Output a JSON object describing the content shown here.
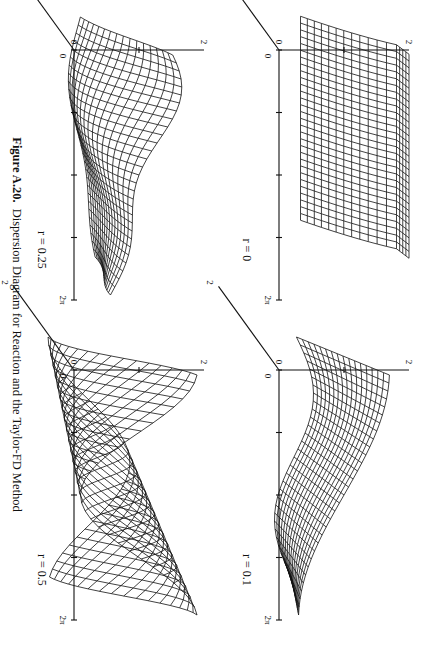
{
  "figure": {
    "number": "Figure A.20.",
    "caption": "Dispersion Diagram for Reaction and the Taylor-FD Method"
  },
  "axes": {
    "x_tick_labels": [
      "0",
      "2π"
    ],
    "x_ticks": 5,
    "z_tick_labels": [
      "0",
      "2"
    ],
    "depth_tick_labels": [
      "0",
      "2"
    ]
  },
  "panels": [
    {
      "id": "r0",
      "label": "r = 0",
      "position": "top-left"
    },
    {
      "id": "r01",
      "label": "r = 0.1",
      "position": "top-right"
    },
    {
      "id": "r025",
      "label": "r = 0.25",
      "position": "bottom-left"
    },
    {
      "id": "r05",
      "label": "r = 0.5",
      "position": "bottom-right"
    }
  ],
  "chart_data": [
    {
      "type": "surface",
      "title": "r = 0",
      "x_range": [
        "0",
        "2π"
      ],
      "z_range": [
        0,
        2
      ],
      "depth_range": [
        0,
        2
      ],
      "description": "flat curved sheet rising near depth 0, constant along x"
    },
    {
      "type": "surface",
      "title": "r = 0.1",
      "x_range": [
        "0",
        "2π"
      ],
      "z_range": [
        0,
        2
      ],
      "depth_range": [
        0,
        2
      ],
      "description": "gently undulating sheet"
    },
    {
      "type": "surface",
      "title": "r = 0.25",
      "x_range": [
        "0",
        "2π"
      ],
      "z_range": [
        0,
        2
      ],
      "depth_range": [
        0,
        2
      ],
      "description": "surface with a pronounced ridge and fold"
    },
    {
      "type": "surface",
      "title": "r = 0.5",
      "x_range": [
        "0",
        "2π"
      ],
      "z_range": [
        0,
        2
      ],
      "depth_range": [
        0,
        2
      ],
      "description": "strongly oscillating surface with two lobes"
    }
  ]
}
